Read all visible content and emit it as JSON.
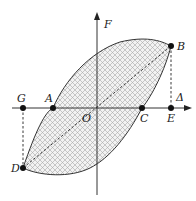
{
  "diagram": {
    "axes": {
      "y_label": "F",
      "x_label": "Δ",
      "origin_label": "O"
    },
    "points": {
      "A": "A",
      "B": "B",
      "C": "C",
      "D": "D",
      "E": "E",
      "G": "G"
    },
    "colors": {
      "stroke": "#333333",
      "hatch": "#9a9a9a",
      "fill": "#eeeeee",
      "point": "#111111"
    }
  }
}
